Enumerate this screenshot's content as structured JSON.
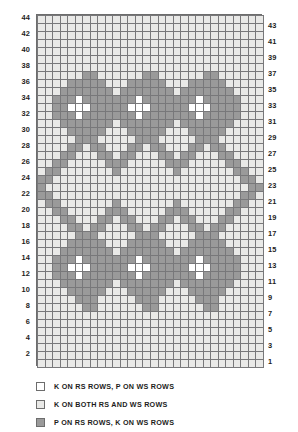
{
  "chart_data": {
    "type": "heatmap",
    "title": "",
    "xlabel": "",
    "ylabel": "",
    "columns": 30,
    "rows": 44,
    "grid_note": "Knitting stitch chart. Row 1 at bottom right, row 44 at top left. Cell codes: 0 = K on RS rows P on WS rows (white), 1 = K on both RS and WS rows (light grey), 2 = P on RS rows K on WS rows (medium grey).",
    "palette": {
      "0": "#ffffff",
      "1": "#e9e9e7",
      "2": "#9a9a9a"
    },
    "row_labels_left": [
      44,
      42,
      40,
      38,
      36,
      34,
      32,
      30,
      28,
      26,
      24,
      22,
      20,
      18,
      16,
      14,
      12,
      10,
      8,
      6,
      4,
      2
    ],
    "row_labels_right": [
      43,
      41,
      39,
      37,
      35,
      33,
      31,
      29,
      27,
      25,
      23,
      21,
      19,
      17,
      15,
      13,
      11,
      9,
      7,
      5,
      3,
      1
    ],
    "cells_top_to_bottom": [
      [
        1,
        1,
        1,
        1,
        1,
        1,
        1,
        1,
        1,
        1,
        1,
        1,
        1,
        1,
        1,
        1,
        1,
        1,
        1,
        1,
        1,
        1,
        1,
        1,
        1,
        1,
        1,
        1,
        1,
        1
      ],
      [
        1,
        1,
        1,
        1,
        1,
        1,
        1,
        1,
        1,
        1,
        1,
        1,
        1,
        1,
        1,
        1,
        1,
        1,
        1,
        1,
        1,
        1,
        1,
        1,
        1,
        1,
        1,
        1,
        1,
        1
      ],
      [
        1,
        1,
        1,
        1,
        1,
        1,
        1,
        1,
        1,
        1,
        1,
        1,
        1,
        1,
        1,
        1,
        1,
        1,
        1,
        1,
        1,
        1,
        1,
        1,
        1,
        1,
        1,
        1,
        1,
        1
      ],
      [
        1,
        1,
        1,
        1,
        1,
        1,
        1,
        1,
        1,
        1,
        1,
        1,
        1,
        1,
        1,
        1,
        1,
        1,
        1,
        1,
        1,
        1,
        1,
        1,
        1,
        1,
        1,
        1,
        1,
        1
      ],
      [
        1,
        1,
        1,
        1,
        1,
        1,
        1,
        1,
        1,
        1,
        1,
        1,
        1,
        1,
        1,
        1,
        1,
        1,
        1,
        1,
        1,
        1,
        1,
        1,
        1,
        1,
        1,
        1,
        1,
        1
      ],
      [
        1,
        1,
        1,
        1,
        1,
        1,
        1,
        1,
        1,
        1,
        1,
        1,
        1,
        1,
        1,
        1,
        1,
        1,
        1,
        1,
        1,
        1,
        1,
        1,
        1,
        1,
        1,
        1,
        1,
        1
      ],
      [
        1,
        1,
        1,
        1,
        1,
        1,
        1,
        1,
        1,
        1,
        1,
        1,
        1,
        1,
        1,
        1,
        1,
        1,
        1,
        1,
        1,
        1,
        1,
        1,
        1,
        1,
        1,
        1,
        1,
        1
      ],
      [
        1,
        1,
        1,
        1,
        1,
        1,
        2,
        2,
        1,
        1,
        1,
        1,
        1,
        1,
        2,
        2,
        1,
        1,
        1,
        1,
        1,
        1,
        2,
        2,
        1,
        1,
        1,
        1,
        1,
        1
      ],
      [
        1,
        1,
        1,
        1,
        2,
        2,
        2,
        2,
        2,
        1,
        1,
        1,
        2,
        2,
        2,
        2,
        2,
        1,
        1,
        1,
        2,
        2,
        2,
        2,
        2,
        1,
        1,
        1,
        1,
        1
      ],
      [
        1,
        1,
        1,
        2,
        2,
        2,
        2,
        2,
        2,
        2,
        1,
        2,
        2,
        2,
        2,
        2,
        2,
        2,
        1,
        2,
        2,
        2,
        2,
        2,
        2,
        2,
        1,
        1,
        1,
        1
      ],
      [
        1,
        1,
        2,
        2,
        2,
        0,
        2,
        2,
        2,
        2,
        2,
        2,
        2,
        0,
        2,
        2,
        2,
        2,
        2,
        2,
        2,
        0,
        2,
        2,
        2,
        2,
        2,
        1,
        1,
        1
      ],
      [
        1,
        1,
        2,
        2,
        0,
        0,
        0,
        2,
        2,
        2,
        2,
        2,
        0,
        0,
        0,
        2,
        2,
        2,
        2,
        2,
        0,
        0,
        0,
        2,
        2,
        2,
        2,
        1,
        1,
        1
      ],
      [
        1,
        1,
        2,
        2,
        2,
        0,
        2,
        2,
        2,
        2,
        2,
        2,
        2,
        0,
        2,
        2,
        2,
        2,
        2,
        2,
        2,
        0,
        2,
        2,
        2,
        2,
        2,
        1,
        1,
        1
      ],
      [
        1,
        1,
        1,
        2,
        2,
        2,
        2,
        2,
        2,
        2,
        1,
        2,
        2,
        2,
        2,
        2,
        2,
        2,
        1,
        2,
        2,
        2,
        2,
        2,
        2,
        2,
        1,
        1,
        1,
        1
      ],
      [
        1,
        1,
        1,
        1,
        2,
        2,
        2,
        2,
        2,
        1,
        1,
        1,
        2,
        2,
        2,
        2,
        2,
        1,
        1,
        1,
        2,
        2,
        2,
        2,
        2,
        1,
        1,
        1,
        1,
        1
      ],
      [
        1,
        1,
        1,
        1,
        1,
        2,
        2,
        2,
        1,
        1,
        1,
        1,
        1,
        2,
        2,
        2,
        1,
        1,
        1,
        1,
        1,
        2,
        2,
        2,
        1,
        1,
        1,
        1,
        1,
        1
      ],
      [
        1,
        1,
        1,
        1,
        2,
        2,
        1,
        2,
        2,
        1,
        1,
        1,
        2,
        2,
        1,
        2,
        2,
        1,
        1,
        1,
        2,
        2,
        1,
        2,
        2,
        1,
        1,
        1,
        1,
        1
      ],
      [
        1,
        1,
        1,
        2,
        2,
        1,
        1,
        1,
        2,
        2,
        1,
        2,
        2,
        1,
        1,
        1,
        2,
        2,
        1,
        2,
        2,
        1,
        1,
        1,
        2,
        2,
        1,
        1,
        1,
        1
      ],
      [
        1,
        1,
        2,
        2,
        1,
        1,
        1,
        1,
        1,
        2,
        2,
        2,
        1,
        1,
        1,
        1,
        1,
        2,
        2,
        2,
        1,
        1,
        1,
        1,
        1,
        2,
        2,
        1,
        1,
        1
      ],
      [
        1,
        2,
        2,
        1,
        1,
        1,
        1,
        1,
        1,
        1,
        2,
        1,
        1,
        1,
        1,
        1,
        1,
        1,
        2,
        1,
        1,
        1,
        1,
        1,
        1,
        1,
        2,
        2,
        1,
        1
      ],
      [
        2,
        2,
        1,
        1,
        1,
        1,
        1,
        1,
        1,
        1,
        1,
        1,
        1,
        1,
        1,
        1,
        1,
        1,
        1,
        1,
        1,
        1,
        1,
        1,
        1,
        1,
        1,
        2,
        2,
        1
      ],
      [
        2,
        1,
        1,
        1,
        1,
        1,
        1,
        1,
        1,
        1,
        1,
        1,
        1,
        1,
        1,
        1,
        1,
        1,
        1,
        1,
        1,
        1,
        1,
        1,
        1,
        1,
        1,
        1,
        2,
        2
      ],
      [
        2,
        2,
        1,
        1,
        1,
        1,
        1,
        1,
        1,
        1,
        1,
        1,
        1,
        1,
        1,
        1,
        1,
        1,
        1,
        1,
        1,
        1,
        1,
        1,
        1,
        1,
        1,
        2,
        2,
        1
      ],
      [
        1,
        2,
        2,
        1,
        1,
        1,
        1,
        1,
        1,
        1,
        2,
        1,
        1,
        1,
        1,
        1,
        1,
        1,
        2,
        1,
        1,
        1,
        1,
        1,
        1,
        1,
        2,
        2,
        1,
        1
      ],
      [
        1,
        1,
        2,
        2,
        1,
        1,
        1,
        1,
        1,
        2,
        2,
        2,
        1,
        1,
        1,
        1,
        1,
        2,
        2,
        2,
        1,
        1,
        1,
        1,
        1,
        2,
        2,
        1,
        1,
        1
      ],
      [
        1,
        1,
        1,
        2,
        2,
        1,
        1,
        1,
        2,
        2,
        1,
        2,
        2,
        1,
        1,
        1,
        2,
        2,
        1,
        2,
        2,
        1,
        1,
        1,
        2,
        2,
        1,
        1,
        1,
        1
      ],
      [
        1,
        1,
        1,
        1,
        2,
        2,
        1,
        2,
        2,
        1,
        1,
        1,
        2,
        2,
        1,
        2,
        2,
        1,
        1,
        1,
        2,
        2,
        1,
        2,
        2,
        1,
        1,
        1,
        1,
        1
      ],
      [
        1,
        1,
        1,
        1,
        1,
        2,
        2,
        2,
        1,
        1,
        1,
        1,
        1,
        2,
        2,
        2,
        1,
        1,
        1,
        1,
        1,
        2,
        2,
        2,
        1,
        1,
        1,
        1,
        1,
        1
      ],
      [
        1,
        1,
        1,
        1,
        2,
        2,
        2,
        2,
        2,
        1,
        1,
        1,
        2,
        2,
        2,
        2,
        2,
        1,
        1,
        1,
        2,
        2,
        2,
        2,
        2,
        1,
        1,
        1,
        1,
        1
      ],
      [
        1,
        1,
        1,
        2,
        2,
        2,
        2,
        2,
        2,
        2,
        1,
        2,
        2,
        2,
        2,
        2,
        2,
        2,
        1,
        2,
        2,
        2,
        2,
        2,
        2,
        2,
        1,
        1,
        1,
        1
      ],
      [
        1,
        1,
        2,
        2,
        2,
        0,
        2,
        2,
        2,
        2,
        2,
        2,
        2,
        0,
        2,
        2,
        2,
        2,
        2,
        2,
        2,
        0,
        2,
        2,
        2,
        2,
        2,
        1,
        1,
        1
      ],
      [
        1,
        1,
        2,
        2,
        0,
        0,
        0,
        2,
        2,
        2,
        2,
        2,
        0,
        0,
        0,
        2,
        2,
        2,
        2,
        2,
        0,
        0,
        0,
        2,
        2,
        2,
        2,
        1,
        1,
        1
      ],
      [
        1,
        1,
        2,
        2,
        2,
        0,
        2,
        2,
        2,
        2,
        2,
        2,
        2,
        0,
        2,
        2,
        2,
        2,
        2,
        2,
        2,
        0,
        2,
        2,
        2,
        2,
        2,
        1,
        1,
        1
      ],
      [
        1,
        1,
        1,
        2,
        2,
        2,
        2,
        2,
        2,
        2,
        1,
        2,
        2,
        2,
        2,
        2,
        2,
        2,
        1,
        2,
        2,
        2,
        2,
        2,
        2,
        2,
        1,
        1,
        1,
        1
      ],
      [
        1,
        1,
        1,
        1,
        2,
        2,
        2,
        2,
        2,
        1,
        1,
        1,
        2,
        2,
        2,
        2,
        2,
        1,
        1,
        1,
        2,
        2,
        2,
        2,
        2,
        1,
        1,
        1,
        1,
        1
      ],
      [
        1,
        1,
        1,
        1,
        1,
        2,
        2,
        2,
        1,
        1,
        1,
        1,
        1,
        2,
        2,
        2,
        1,
        1,
        1,
        1,
        1,
        2,
        2,
        2,
        1,
        1,
        1,
        1,
        1,
        1
      ],
      [
        1,
        1,
        1,
        1,
        1,
        1,
        2,
        2,
        1,
        1,
        1,
        1,
        1,
        1,
        2,
        2,
        1,
        1,
        1,
        1,
        1,
        1,
        2,
        2,
        1,
        1,
        1,
        1,
        1,
        1
      ],
      [
        1,
        1,
        1,
        1,
        1,
        1,
        1,
        1,
        1,
        1,
        1,
        1,
        1,
        1,
        1,
        1,
        1,
        1,
        1,
        1,
        1,
        1,
        1,
        1,
        1,
        1,
        1,
        1,
        1,
        1
      ],
      [
        1,
        1,
        1,
        1,
        1,
        1,
        1,
        1,
        1,
        1,
        1,
        1,
        1,
        1,
        1,
        1,
        1,
        1,
        1,
        1,
        1,
        1,
        1,
        1,
        1,
        1,
        1,
        1,
        1,
        1
      ],
      [
        1,
        1,
        1,
        1,
        1,
        1,
        1,
        1,
        1,
        1,
        1,
        1,
        1,
        1,
        1,
        1,
        1,
        1,
        1,
        1,
        1,
        1,
        1,
        1,
        1,
        1,
        1,
        1,
        1,
        1
      ],
      [
        1,
        1,
        1,
        1,
        1,
        1,
        1,
        1,
        1,
        1,
        1,
        1,
        1,
        1,
        1,
        1,
        1,
        1,
        1,
        1,
        1,
        1,
        1,
        1,
        1,
        1,
        1,
        1,
        1,
        1
      ],
      [
        1,
        1,
        1,
        1,
        1,
        1,
        1,
        1,
        1,
        1,
        1,
        1,
        1,
        1,
        1,
        1,
        1,
        1,
        1,
        1,
        1,
        1,
        1,
        1,
        1,
        1,
        1,
        1,
        1,
        1
      ],
      [
        1,
        1,
        1,
        1,
        1,
        1,
        1,
        1,
        1,
        1,
        1,
        1,
        1,
        1,
        1,
        1,
        1,
        1,
        1,
        1,
        1,
        1,
        1,
        1,
        1,
        1,
        1,
        1,
        1,
        1
      ],
      [
        1,
        1,
        1,
        1,
        1,
        1,
        1,
        1,
        1,
        1,
        1,
        1,
        1,
        1,
        1,
        1,
        1,
        1,
        1,
        1,
        1,
        1,
        1,
        1,
        1,
        1,
        1,
        1,
        1,
        1
      ]
    ]
  },
  "legend": {
    "items": [
      {
        "swatch": "0",
        "label": "K ON RS ROWS, P ON WS ROWS"
      },
      {
        "swatch": "1",
        "label": "K ON BOTH RS AND WS ROWS"
      },
      {
        "swatch": "2",
        "label": "P ON RS ROWS, K ON WS ROWS"
      }
    ]
  }
}
